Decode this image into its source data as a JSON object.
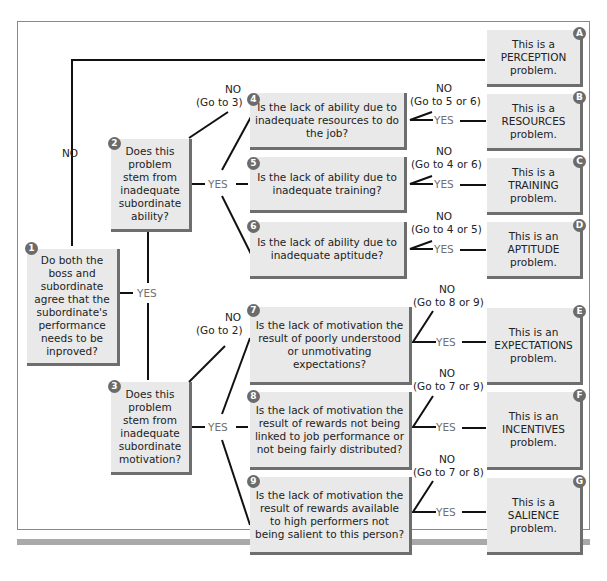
{
  "decisions": [
    {
      "id": "1",
      "text": "Do both the boss and subordinate agree that the subordinate's performance needs to be inproved?"
    },
    {
      "id": "2",
      "text": "Does this problem stem from inadequate subordinate ability?"
    },
    {
      "id": "3",
      "text": "Does this problem stem from inadequate subordinate motivation?"
    },
    {
      "id": "4",
      "text": "Is the lack of ability due to inadequate resources to do the job?"
    },
    {
      "id": "5",
      "text": "Is the lack of ability due to inadequate training?"
    },
    {
      "id": "6",
      "text": "Is the lack of ability due to inadequate aptitude?"
    },
    {
      "id": "7",
      "text": "Is the lack of motivation the result of poorly understood or unmotivating expectations?"
    },
    {
      "id": "8",
      "text": "Is the lack of motivation the result of rewards not being linked to job performance or not being fairly distributed?"
    },
    {
      "id": "9",
      "text": "Is the lack of motivation the result of rewards available to high performers not being salient to this person?"
    }
  ],
  "outcomes": [
    {
      "id": "A",
      "text": "This is a PERCEPTION problem."
    },
    {
      "id": "B",
      "text": "This is a RESOURCES problem."
    },
    {
      "id": "C",
      "text": "This is a TRAINING problem."
    },
    {
      "id": "D",
      "text": "This is an APTITUDE problem."
    },
    {
      "id": "E",
      "text": "This is an EXPECTATIONS problem."
    },
    {
      "id": "F",
      "text": "This is an INCENTIVES problem."
    },
    {
      "id": "G",
      "text": "This is a SALIENCE problem."
    }
  ],
  "edge_labels": {
    "no": "NO",
    "yes": "YES",
    "go_to_3": "(Go to 3)",
    "go_to_2": "(Go to 2)",
    "go_to_5_or_6": "(Go to 5 or 6)",
    "go_to_4_or_6": "(Go to 4 or 6)",
    "go_to_4_or_5": "(Go to 4 or 5)",
    "go_to_8_or_9": "(Go to 8 or 9)",
    "go_to_7_or_9": "(Go to 7 or 9)",
    "go_to_7_or_8": "(Go to 7 or 8)"
  },
  "colors": {
    "box_fill": "#e9e9e9",
    "box_shadow": "#6e6e6e",
    "badge": "#6b6b6b",
    "line": "#111111",
    "yes_text": "#707070"
  }
}
